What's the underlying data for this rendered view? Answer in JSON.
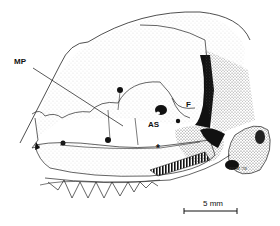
{
  "figure": {
    "labels": {
      "mp": "MP",
      "f": "F",
      "as": "AS",
      "asterisk": "*"
    },
    "scale_bar": {
      "label": "5 mm"
    },
    "signature": "ECM '78"
  }
}
